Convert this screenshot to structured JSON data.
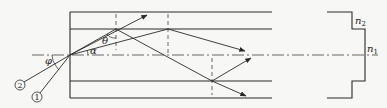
{
  "diagram": {
    "type": "optical-fiber-step-index-ray-diagram",
    "colors": {
      "line": "#2a2a2a",
      "background": "#f7f7f5"
    },
    "labels": {
      "phi": "φ",
      "theta": "θ",
      "alpha": "α",
      "ray1": "1",
      "ray2": "2",
      "n1_base": "n",
      "n1_sub": "1",
      "n2_base": "n",
      "n2_sub": "2"
    },
    "regions": [
      {
        "name": "cladding-top",
        "index": "n2"
      },
      {
        "name": "core",
        "index": "n1"
      },
      {
        "name": "cladding-bottom",
        "index": "n2"
      }
    ],
    "rays": [
      {
        "id": "2",
        "description": "incident at angle phi, refracted at theta, escapes cladding"
      },
      {
        "id": "1",
        "description": "incident at smaller angle, refracted at alpha, guided by total internal reflection"
      }
    ]
  }
}
